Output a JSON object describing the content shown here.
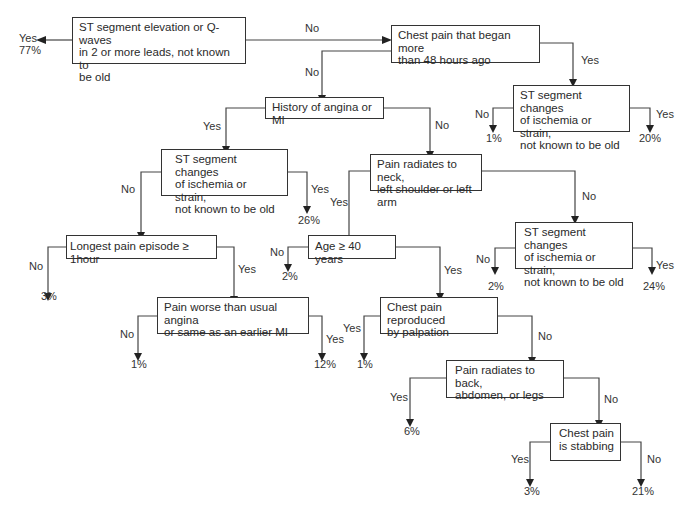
{
  "nodes": {
    "n1": "ST segment elevation or Q-waves\nin 2 or more leads, not known to\nbe old",
    "n2": "Chest pain that began more\nthan 48 hours ago",
    "n3": "ST segment changes\nof ischemia or strain,\nnot known to be old",
    "n4": "History of angina or MI",
    "n5": "ST segment changes\nof ischemia or strain,\nnot known to be old",
    "n6": "Pain radiates to neck,\nleft shoulder or left arm",
    "n7": "Longest pain episode ≥ 1hour",
    "n8": "Age ≥ 40 years",
    "n9": "ST segment changes\nof ischemia or strain,\nnot known to be old",
    "n10": "Pain worse than usual angina\nor same as an earlier MI",
    "n11": "Chest pain reproduced\nby palpation",
    "n12": "Pain radiates to back,\nabdomen, or legs",
    "n13": "Chest pain\nis stabbing"
  },
  "edges": {
    "n1_yes": "Yes",
    "n1_no": "No",
    "n2_yes": "Yes",
    "n2_no": "No",
    "n3_no": "No",
    "n3_yes": "Yes",
    "n4_yes": "Yes",
    "n4_no": "No",
    "n5_no": "No",
    "n5_yes": "Yes",
    "n6_yes": "Yes",
    "n6_no": "No",
    "n7_no": "No",
    "n7_yes": "Yes",
    "n8_no": "No",
    "n8_yes": "Yes",
    "n9_no": "No",
    "n9_yes": "Yes",
    "n10_no": "No",
    "n10_yes": "Yes",
    "n11_yes": "Yes",
    "n11_no": "No",
    "n12_yes": "Yes",
    "n12_no": "No",
    "n13_yes": "Yes",
    "n13_no": "No"
  },
  "outcomes": {
    "n1_yes": "77%",
    "n3_no": "1%",
    "n3_yes": "20%",
    "n5_yes": "26%",
    "n7_no": "3%",
    "n8_no": "2%",
    "n9_no": "2%",
    "n9_yes": "24%",
    "n10_no": "1%",
    "n10_yes": "12%",
    "n11_yes": "1%",
    "n12_yes": "6%",
    "n13_yes": "3%",
    "n13_no": "21%"
  }
}
